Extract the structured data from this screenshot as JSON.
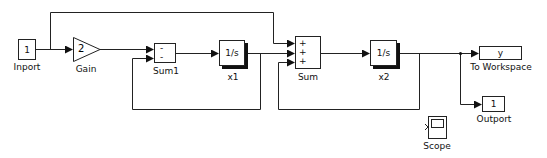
{
  "diagram": {
    "type": "simulink-block-diagram",
    "blocks": [
      {
        "id": "inport",
        "label": "Inport",
        "content": "1"
      },
      {
        "id": "gain",
        "label": "Gain",
        "content": "2"
      },
      {
        "id": "sum1",
        "label": "Sum1",
        "signs": [
          "-",
          "-"
        ]
      },
      {
        "id": "int1",
        "label": "x1",
        "content": "1/s"
      },
      {
        "id": "sum",
        "label": "Sum",
        "signs": [
          "+",
          "+",
          "+"
        ]
      },
      {
        "id": "int2",
        "label": "x2",
        "content": "1/s"
      },
      {
        "id": "toworkspace",
        "label": "To Workspace",
        "content": "y"
      },
      {
        "id": "outport",
        "label": "Outport",
        "content": "1"
      },
      {
        "id": "scope",
        "label": "Scope"
      }
    ],
    "connections": [
      {
        "from": "inport",
        "to": "gain"
      },
      {
        "from": "inport",
        "to": "sum",
        "port": 1
      },
      {
        "from": "gain",
        "to": "sum1",
        "port": 1
      },
      {
        "from": "sum1",
        "to": "int1"
      },
      {
        "from": "int1",
        "to": "sum",
        "port": 2
      },
      {
        "from": "int1",
        "to": "sum1",
        "port": 2
      },
      {
        "from": "sum",
        "to": "int2"
      },
      {
        "from": "int2",
        "to": "toworkspace"
      },
      {
        "from": "int2",
        "to": "outport"
      },
      {
        "from": "int2",
        "to": "sum",
        "port": 3
      }
    ]
  }
}
